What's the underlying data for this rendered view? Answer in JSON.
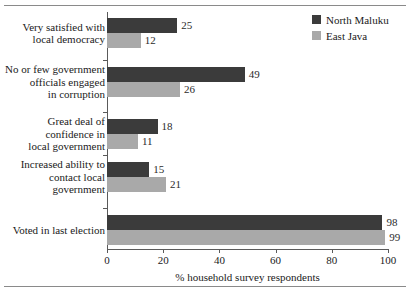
{
  "chart_data": {
    "type": "bar",
    "orientation": "horizontal",
    "title": "",
    "xlabel": "% household survey respondents",
    "ylabel": "",
    "xlim": [
      0,
      100
    ],
    "xticks": [
      0,
      20,
      40,
      60,
      80,
      100
    ],
    "grid": false,
    "legend_position": "top-right",
    "categories": [
      "Very satisfied with\nlocal democracy",
      "No or few government\nofficials engaged\nin corruption",
      "Great deal of\nconfidence in\nlocal government",
      "Increased ability to\ncontact local\ngovernment",
      "Voted in last election"
    ],
    "series": [
      {
        "name": "North Maluku",
        "color": "#3b3b3b",
        "values": [
          25,
          49,
          18,
          15,
          98
        ]
      },
      {
        "name": "East Java",
        "color": "#a9a9a9",
        "values": [
          12,
          26,
          11,
          21,
          99
        ]
      }
    ]
  },
  "legend": {
    "items": [
      {
        "label": "North Maluku",
        "color": "#3b3b3b"
      },
      {
        "label": "East Java",
        "color": "#a9a9a9"
      }
    ]
  },
  "axis": {
    "x_tick_labels": [
      "0",
      "20",
      "40",
      "60",
      "80",
      "100"
    ],
    "x_axis_title": "% household survey respondents"
  },
  "values_text": {
    "s0": [
      "25",
      "49",
      "18",
      "15",
      "98"
    ],
    "s1": [
      "12",
      "26",
      "11",
      "21",
      "99"
    ]
  },
  "category_labels": [
    "Very satisfied with\nlocal democracy",
    "No or few government\nofficials engaged\nin corruption",
    "Great deal of\nconfidence in\nlocal government",
    "Increased ability to\ncontact local\ngovernment",
    "Voted in last election"
  ]
}
